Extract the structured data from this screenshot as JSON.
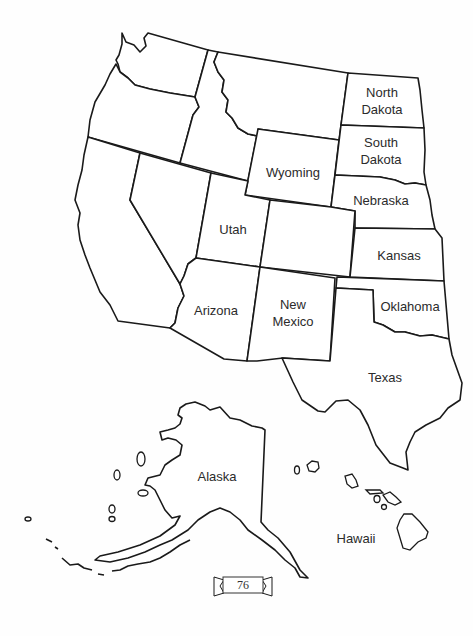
{
  "page": {
    "page_number": "76"
  },
  "map": {
    "colors": {
      "stroke": "#1a1a1a",
      "fill": "#ffffff",
      "label": "#2b2b2b",
      "background": "#fefefe"
    },
    "labeled_states": [
      {
        "id": "north-dakota",
        "label": "North\nDakota",
        "line1": "North",
        "line2": "Dakota"
      },
      {
        "id": "south-dakota",
        "label": "South\nDakota",
        "line1": "South",
        "line2": "Dakota"
      },
      {
        "id": "wyoming",
        "label": "Wyoming"
      },
      {
        "id": "nebraska",
        "label": "Nebraska"
      },
      {
        "id": "utah",
        "label": "Utah"
      },
      {
        "id": "kansas",
        "label": "Kansas"
      },
      {
        "id": "arizona",
        "label": "Arizona"
      },
      {
        "id": "new-mexico",
        "label": "New\nMexico",
        "line1": "New",
        "line2": "Mexico"
      },
      {
        "id": "oklahoma",
        "label": "Oklahoma"
      },
      {
        "id": "texas",
        "label": "Texas"
      },
      {
        "id": "alaska",
        "label": "Alaska"
      },
      {
        "id": "hawaii",
        "label": "Hawaii"
      }
    ],
    "unlabeled_states": [
      "Washington",
      "Oregon",
      "California",
      "Nevada",
      "Idaho",
      "Montana",
      "Colorado"
    ]
  }
}
